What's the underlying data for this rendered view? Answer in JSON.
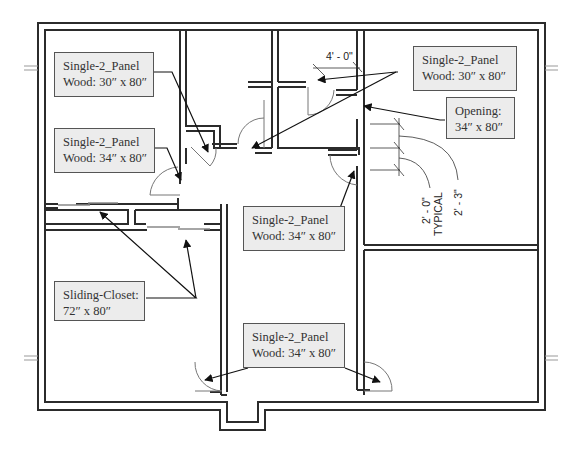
{
  "diagram": {
    "type": "floor-plan",
    "colors": {
      "wall": "#2b2b2b",
      "tag_fill": "#ececec",
      "tag_border": "#555555",
      "door": "#777777",
      "text": "#333333"
    }
  },
  "tags": [
    {
      "id": "door-tag-1",
      "line1": "Single-2_Panel",
      "line2": "Wood: 30″ x 80″"
    },
    {
      "id": "door-tag-2",
      "line1": "Single-2_Panel",
      "line2": "Wood: 34″ x 80″"
    },
    {
      "id": "door-tag-3",
      "line1": "Single-2_Panel",
      "line2": "Wood: 30″ x 80″"
    },
    {
      "id": "opening-tag",
      "line1": "Opening:",
      "line2": "34″ x 80″"
    },
    {
      "id": "door-tag-4",
      "line1": "Single-2_Panel",
      "line2": "Wood: 34″ x 80″"
    },
    {
      "id": "closet-tag",
      "line1": "Sliding-Closet:",
      "line2": "72″ x 80″"
    },
    {
      "id": "door-tag-5",
      "line1": "Single-2_Panel",
      "line2": "Wood: 34″ x 80″"
    }
  ],
  "dimensions": {
    "top": "4' - 0\"",
    "typical_a": "2' - 0\"",
    "typical_a_note": "TYPICAL",
    "typical_b": "2' - 3\""
  }
}
